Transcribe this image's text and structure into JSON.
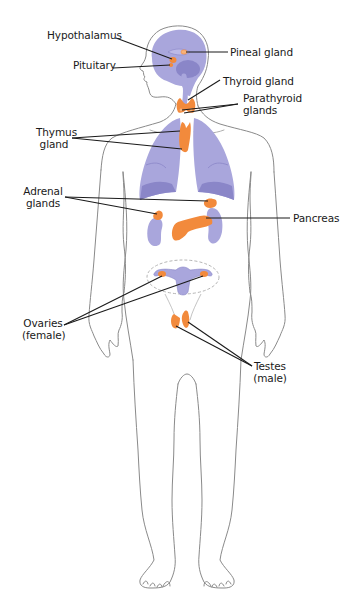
{
  "diagram": {
    "colors": {
      "outline": "#8a8a8a",
      "organ_fill": "#a9a6dc",
      "organ_shade": "#8a86c8",
      "gland_fill": "#f28a3c",
      "gland_highlight": "#f7b27a",
      "leader_line": "#1a1a1a",
      "dashed_outline": "#b5b5b5",
      "text": "#1a1a1a"
    },
    "labels": [
      {
        "id": "hypothalamus",
        "text": "Hypothalamus"
      },
      {
        "id": "pituitary",
        "text": "Pituitary"
      },
      {
        "id": "pineal",
        "text": "Pineal gland"
      },
      {
        "id": "thyroid",
        "text": "Thyroid gland"
      },
      {
        "id": "parathyroid_1",
        "text": "Parathyroid"
      },
      {
        "id": "parathyroid_2",
        "text": "glands"
      },
      {
        "id": "thymus_1",
        "text": "Thymus"
      },
      {
        "id": "thymus_2",
        "text": "gland"
      },
      {
        "id": "adrenal_1",
        "text": "Adrenal"
      },
      {
        "id": "adrenal_2",
        "text": "glands"
      },
      {
        "id": "pancreas",
        "text": "Pancreas"
      },
      {
        "id": "ovaries_1",
        "text": "Ovaries"
      },
      {
        "id": "ovaries_2",
        "text": "(female)"
      },
      {
        "id": "testes_1",
        "text": "Testes"
      },
      {
        "id": "testes_2",
        "text": "(male)"
      }
    ]
  }
}
